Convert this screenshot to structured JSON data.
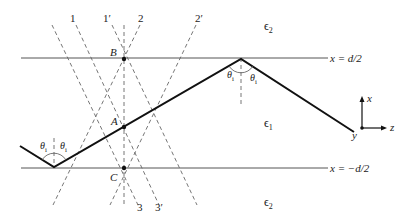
{
  "figure": {
    "boundaries": {
      "top": {
        "label": "x = d/2",
        "y": 58
      },
      "bottom": {
        "label": "x = −d/2",
        "y": 168
      }
    },
    "regions": {
      "cladding_top": "ε2",
      "core": "ε1",
      "cladding_bottom": "ε2"
    },
    "points": {
      "B": "B",
      "A": "A",
      "C": "C"
    },
    "wavefront_labels": {
      "w1": "1",
      "w1p": "1′",
      "w2": "2",
      "w2p": "2′",
      "w3": "3",
      "w3p": "3′"
    },
    "angle_label": "θ",
    "angle_sub": "i",
    "axes": {
      "x": "x",
      "y": "y",
      "z": "z"
    },
    "colors": {
      "ray": "#111111",
      "boundary": "#555555",
      "dashed": "#666666"
    }
  }
}
